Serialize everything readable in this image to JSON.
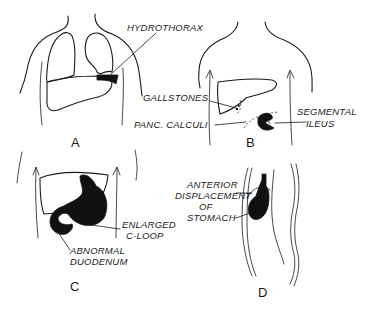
{
  "figure": {
    "panels": [
      {
        "id": "A",
        "letter": "A",
        "labels": [
          "HYDROTHORAX"
        ]
      },
      {
        "id": "B",
        "letter": "B",
        "labels": [
          "GALLSTONES",
          "PANC. CALCULI",
          "SEGMENTAL",
          "ILEUS"
        ]
      },
      {
        "id": "C",
        "letter": "C",
        "labels": [
          "ENLARGED",
          "C-LOOP",
          "ABNORMAL",
          "DUODENUM"
        ]
      },
      {
        "id": "D",
        "letter": "D",
        "labels": [
          "ANTERIOR",
          "DISPLACEMENT",
          "OF",
          "STOMACH"
        ]
      }
    ],
    "colors": {
      "ink": "#1a1a1a",
      "background": "#ffffff"
    }
  }
}
